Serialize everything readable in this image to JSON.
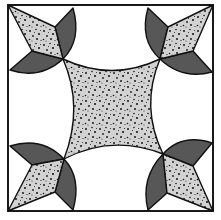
{
  "colors": {
    "background": "#ffffff",
    "outline": "#111111",
    "dark_fill": "#575757",
    "speckled_fill": "#d2d2d2",
    "speckle_dot": "#1a1a1a"
  },
  "block": {
    "frame": {
      "x": 8,
      "y": 5,
      "width": 205,
      "height": 206
    },
    "center_shape": "speckled-concave-square",
    "corner_units": [
      {
        "position": "top-left",
        "kite": [
          [
            8,
            5
          ],
          [
            55,
            27
          ],
          [
            63,
            59
          ],
          [
            32,
            51
          ]
        ],
        "wing_a": {
          "from": [
            55,
            27
          ],
          "edge": [
            73,
            8
          ],
          "to": [
            63,
            59
          ]
        },
        "wing_b": {
          "from": [
            32,
            51
          ],
          "edge": [
            10,
            70
          ],
          "to": [
            63,
            59
          ]
        }
      },
      {
        "position": "top-right",
        "kite": [
          [
            213,
            5
          ],
          [
            168,
            27
          ],
          [
            160,
            59
          ],
          [
            193,
            51
          ]
        ],
        "wing_a": {
          "from": [
            168,
            27
          ],
          "edge": [
            148,
            8
          ],
          "to": [
            160,
            59
          ]
        },
        "wing_b": {
          "from": [
            193,
            51
          ],
          "edge": [
            212,
            72
          ],
          "to": [
            160,
            59
          ]
        }
      },
      {
        "position": "bottom-left",
        "kite": [
          [
            8,
            211
          ],
          [
            32,
            165
          ],
          [
            63,
            159
          ],
          [
            55,
            192
          ]
        ],
        "wing_a": {
          "from": [
            32,
            165
          ],
          "edge": [
            10,
            146
          ],
          "to": [
            63,
            159
          ]
        },
        "wing_b": {
          "from": [
            55,
            192
          ],
          "edge": [
            73,
            210
          ],
          "to": [
            63,
            159
          ]
        }
      },
      {
        "position": "bottom-right",
        "kite": [
          [
            213,
            211
          ],
          [
            193,
            166
          ],
          [
            163,
            154
          ],
          [
            167,
            193
          ]
        ],
        "wing_a": {
          "from": [
            193,
            166
          ],
          "edge": [
            212,
            143
          ],
          "to": [
            163,
            154
          ]
        },
        "wing_b": {
          "from": [
            167,
            193
          ],
          "edge": [
            148,
            210
          ],
          "to": [
            163,
            154
          ]
        }
      }
    ]
  }
}
